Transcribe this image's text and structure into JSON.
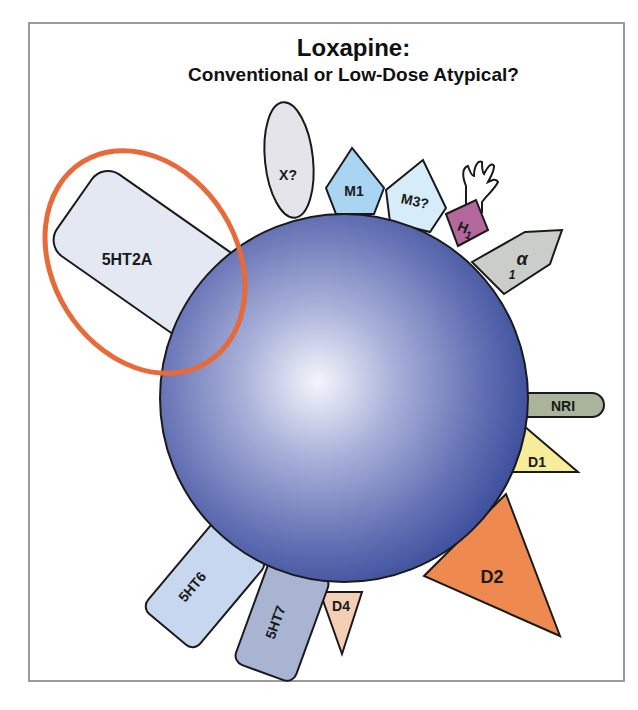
{
  "title": {
    "main": "Loxapine:",
    "subtitle": "Conventional or Low-Dose Atypical?"
  },
  "colors": {
    "frame_border": "#9a9a9a",
    "sphere_highlight": "#f4f6fb",
    "sphere_mid": "#8a94c8",
    "sphere_edge": "#3d4f9c",
    "highlight_ring": "#e8693a"
  },
  "highlight": {
    "target": "5HT2A",
    "shape": "ellipse",
    "color": "#e8693a"
  },
  "receptors": [
    {
      "id": "5ht2a",
      "label": "5HT2A",
      "shape": "rounded-rect",
      "fill": "#e4e8f3",
      "highlighted": true
    },
    {
      "id": "x",
      "label": "X?",
      "shape": "ellipse",
      "fill": "#e4e4ea"
    },
    {
      "id": "m1",
      "label": "M1",
      "shape": "pentagon",
      "fill": "#a9d4f2"
    },
    {
      "id": "m3",
      "label": "M3?",
      "shape": "pentagon",
      "fill": "#d6ecf8"
    },
    {
      "id": "h1",
      "label": "H",
      "subscript": "1",
      "shape": "square-with-hand",
      "fill": "#b3679a"
    },
    {
      "id": "alpha1",
      "label": "α",
      "subscript": "1",
      "shape": "arrow-pentagon",
      "fill": "#cacdca"
    },
    {
      "id": "nri",
      "label": "NRI",
      "shape": "capsule",
      "fill": "#a9b49b"
    },
    {
      "id": "d1",
      "label": "D1",
      "shape": "triangle",
      "fill": "#f6ec9a"
    },
    {
      "id": "d2",
      "label": "D2",
      "shape": "triangle",
      "fill": "#ee8a4f"
    },
    {
      "id": "d4",
      "label": "D4",
      "shape": "triangle",
      "fill": "#f2cfb5"
    },
    {
      "id": "5ht7",
      "label": "5HT7",
      "shape": "rounded-rect",
      "fill": "#a9b4d2"
    },
    {
      "id": "5ht6",
      "label": "5HT6",
      "shape": "rounded-rect",
      "fill": "#c7d7ef"
    }
  ]
}
